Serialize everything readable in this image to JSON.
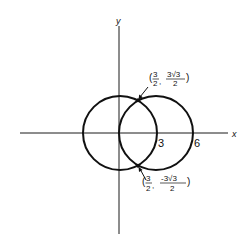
{
  "diagram": {
    "axes": {
      "x_label": "x",
      "y_label": "y"
    },
    "circles": [
      {
        "name": "circle-centered-origin",
        "center": [
          0,
          0
        ],
        "radius": 3
      },
      {
        "name": "circle-centered-3",
        "center": [
          3,
          0
        ],
        "radius": 3
      }
    ],
    "ticks": {
      "three": "3",
      "six": "6"
    },
    "points": {
      "upper": {
        "open": "(",
        "x_num": "3",
        "x_den": "2",
        "comma": ",",
        "y_num": "3√3",
        "y_den": "2",
        "close": ")"
      },
      "lower": {
        "open": "(",
        "x_num": "3",
        "x_den": "2",
        "comma": ",",
        "y_num": "-3√3",
        "y_den": "2",
        "close": ")"
      }
    },
    "colors": {
      "stroke": "#111111",
      "background": "#ffffff"
    }
  }
}
